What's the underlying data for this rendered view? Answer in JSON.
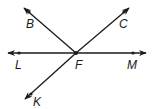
{
  "diagram": {
    "type": "geometry-lines-rays",
    "colors": {
      "stroke": "#1a1a1a",
      "background": "#ffffff"
    },
    "vertex": {
      "name": "F",
      "x": 76,
      "y": 53
    },
    "points": [
      {
        "name": "L",
        "x": 19,
        "y": 53,
        "label_x": 16,
        "label_y": 68
      },
      {
        "name": "M",
        "x": 133,
        "y": 53,
        "label_x": 128,
        "label_y": 68
      },
      {
        "name": "B",
        "x": 29,
        "y": 13,
        "label_x": 26,
        "label_y": 27
      },
      {
        "name": "C",
        "x": 123,
        "y": 13,
        "label_x": 119,
        "label_y": 27
      },
      {
        "name": "K",
        "x": 31,
        "y": 93,
        "label_x": 33,
        "label_y": 106
      },
      {
        "name": "F",
        "x": 76,
        "y": 53,
        "label_x": 75,
        "label_y": 68
      }
    ],
    "line": {
      "name": "line LM",
      "through": [
        "L",
        "M"
      ]
    },
    "rays": [
      {
        "name": "ray FB",
        "from": "F",
        "through": "B"
      },
      {
        "name": "ray FC",
        "from": "F",
        "through": "C"
      },
      {
        "name": "ray FK",
        "from": "F",
        "through": "K"
      }
    ],
    "labels": {
      "B": "B",
      "C": "C",
      "L": "L",
      "F": "F",
      "M": "M",
      "K": "K"
    }
  }
}
